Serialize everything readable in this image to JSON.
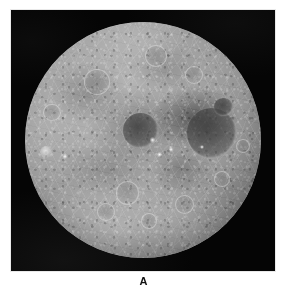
{
  "figure": {
    "panel_label": "A",
    "caption_position": "below",
    "background_color": "#ffffff",
    "plate_color": "#050505",
    "plate_border_color": "#e9e9e9"
  },
  "image": {
    "subject": "moon-disc",
    "description": "Full-disc grayscale spacecraft photograph of a heavily cratered icy moon against black sky",
    "color_mode": "grayscale",
    "disc": {
      "center_x": 143,
      "center_y": 142,
      "radius": 118,
      "highlight_color": "#b9b9b9",
      "midtone_color": "#8e8e8e",
      "shadow_color": "#434343"
    },
    "features": [
      {
        "name": "large-dark-basin",
        "cx": 79,
        "cy": 47,
        "r": 10.5,
        "kind": "dark"
      },
      {
        "name": "dark-crater-right-upper",
        "cx": 84,
        "cy": 36,
        "r": 4.0,
        "kind": "dark"
      },
      {
        "name": "dark-patch-center",
        "cx": 49,
        "cy": 46,
        "r": 7.5,
        "kind": "dark"
      },
      {
        "name": "crater-northwest",
        "cx": 30,
        "cy": 25,
        "r": 5.0,
        "kind": "ring"
      },
      {
        "name": "crater-north-rim",
        "cx": 55,
        "cy": 14,
        "r": 4.2,
        "kind": "ring"
      },
      {
        "name": "crater-west-limb",
        "cx": 11,
        "cy": 38,
        "r": 3.2,
        "kind": "ring"
      },
      {
        "name": "ray-crater-west",
        "cx": 9,
        "cy": 55,
        "r": 2.6,
        "kind": "bright"
      },
      {
        "name": "crater-south-central",
        "cx": 43,
        "cy": 72,
        "r": 4.6,
        "kind": "ring"
      },
      {
        "name": "crater-south-a",
        "cx": 34,
        "cy": 80,
        "r": 3.4,
        "kind": "ring"
      },
      {
        "name": "crater-south-b",
        "cx": 52,
        "cy": 84,
        "r": 3.0,
        "kind": "ring"
      },
      {
        "name": "crater-southeast",
        "cx": 67,
        "cy": 77,
        "r": 3.6,
        "kind": "ring"
      },
      {
        "name": "crater-east-lower",
        "cx": 83,
        "cy": 66,
        "r": 3.0,
        "kind": "ring"
      },
      {
        "name": "crater-northeast",
        "cx": 71,
        "cy": 22,
        "r": 3.4,
        "kind": "ring"
      },
      {
        "name": "crater-east-limb",
        "cx": 92,
        "cy": 52,
        "r": 2.6,
        "kind": "ring"
      },
      {
        "name": "bright-spot-center-a",
        "cx": 54,
        "cy": 50,
        "r": 1.2,
        "kind": "spot"
      },
      {
        "name": "bright-spot-center-b",
        "cx": 57,
        "cy": 56,
        "r": 1.0,
        "kind": "spot"
      },
      {
        "name": "bright-spot-center-c",
        "cx": 62,
        "cy": 54,
        "r": 0.9,
        "kind": "spot"
      },
      {
        "name": "bright-spot-east",
        "cx": 75,
        "cy": 53,
        "r": 0.9,
        "kind": "spot"
      },
      {
        "name": "bright-spot-west",
        "cx": 17,
        "cy": 57,
        "r": 1.0,
        "kind": "spot"
      }
    ]
  }
}
